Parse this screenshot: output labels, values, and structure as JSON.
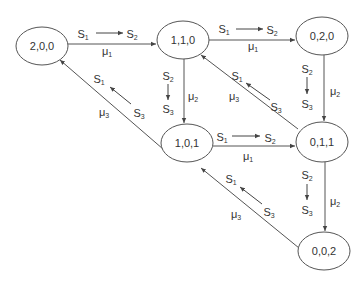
{
  "diagram": {
    "type": "state-transition",
    "nodes": [
      {
        "id": "n200",
        "label": "2,0,0",
        "cx": 42,
        "cy": 46
      },
      {
        "id": "n110",
        "label": "1,1,0",
        "cx": 183,
        "cy": 40
      },
      {
        "id": "n020",
        "label": "0,2,0",
        "cx": 322,
        "cy": 36
      },
      {
        "id": "n101",
        "label": "1,0,1",
        "cx": 187,
        "cy": 143
      },
      {
        "id": "n011",
        "label": "0,1,1",
        "cx": 322,
        "cy": 142
      },
      {
        "id": "n002",
        "label": "0,0,2",
        "cx": 324,
        "cy": 251
      }
    ],
    "edges": [
      {
        "from": "2,0,0",
        "to": "1,1,0",
        "rate": "μ1",
        "transition_from": "S1",
        "transition_to": "S2"
      },
      {
        "from": "1,1,0",
        "to": "0,2,0",
        "rate": "μ1",
        "transition_from": "S1",
        "transition_to": "S2"
      },
      {
        "from": "1,1,0",
        "to": "1,0,1",
        "rate": "μ2",
        "transition_from": "S2",
        "transition_to": "S3"
      },
      {
        "from": "0,2,0",
        "to": "0,1,1",
        "rate": "μ2",
        "transition_from": "S2",
        "transition_to": "S3"
      },
      {
        "from": "1,0,1",
        "to": "2,0,0",
        "rate": "μ3",
        "transition_from": "S3",
        "transition_to": "S1"
      },
      {
        "from": "0,1,1",
        "to": "1,1,0",
        "rate": "μ3",
        "transition_from": "S3",
        "transition_to": "S1"
      },
      {
        "from": "1,0,1",
        "to": "0,1,1",
        "rate": "μ1",
        "transition_from": "S1",
        "transition_to": "S2"
      },
      {
        "from": "0,1,1",
        "to": "0,0,2",
        "rate": "μ2",
        "transition_from": "S2",
        "transition_to": "S3"
      },
      {
        "from": "0,0,2",
        "to": "1,0,1",
        "rate": "μ3",
        "transition_from": "S3",
        "transition_to": "S1"
      }
    ]
  },
  "symbols": {
    "S": "S",
    "mu": "μ",
    "i1": "1",
    "i2": "2",
    "i3": "3"
  }
}
